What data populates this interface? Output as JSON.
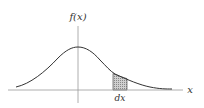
{
  "diagram": {
    "y_axis_label": "f(x)",
    "x_axis_label": "x",
    "interval_label": "dx",
    "curve": "bell-shaped probability density",
    "shaded_region": "area under curve over interval dx",
    "colors": {
      "axis": "#999999",
      "curve": "#333333",
      "shade": "#bbbbbb"
    }
  }
}
